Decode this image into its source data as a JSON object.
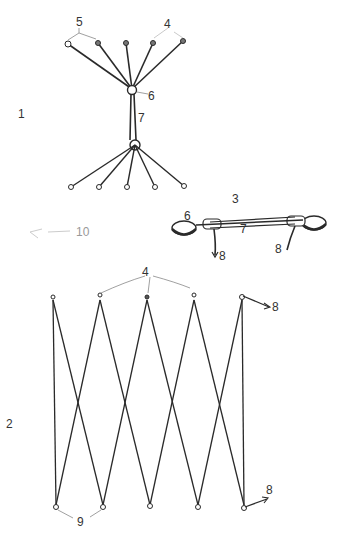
{
  "figures": [
    {
      "id": "fig1",
      "number": "1",
      "description": "Two fan clusters of five cords converging to hubs joined by a connector",
      "labels": {
        "cords": "4",
        "end_rings": "5",
        "hub": "6",
        "connector": "7"
      }
    },
    {
      "id": "fig2",
      "number": "2",
      "description": "Zigzag cord net with five top and five bottom attachment points",
      "labels": {
        "cords": "4",
        "hooks": "8",
        "bottom_rings": "9"
      }
    },
    {
      "id": "fig3",
      "number": "3",
      "description": "Side view of connector with two pads and hooks",
      "labels": {
        "pad": "6",
        "connector": "7",
        "hook_left": "8",
        "hook_right": "8"
      }
    },
    {
      "id": "fig10",
      "number": "10",
      "description": "Faint small element"
    }
  ],
  "colors": {
    "line": "#2a2a2a",
    "leader": "#888888",
    "text": "#333333"
  }
}
